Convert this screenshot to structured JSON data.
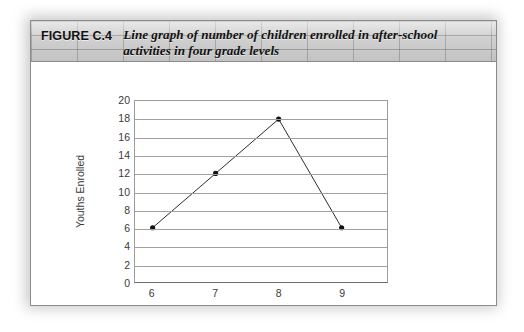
{
  "figure": {
    "number_label": "FIGURE C.4",
    "caption_line1": "Line graph of number of children enrolled in after-school",
    "caption_line2": "activities in four grade levels"
  },
  "colors": {
    "header_band": "#cfcfcf",
    "card_border": "#8c8c8c",
    "gridline": "#a0a0a0",
    "series_line": "#2b2b2b",
    "marker": "#111111",
    "text": "#3a3a3a"
  },
  "chart_data": {
    "type": "line",
    "title": "",
    "xlabel": "Grade Levels",
    "ylabel": "Youths Enrolled",
    "categories": [
      "6",
      "7",
      "8",
      "9"
    ],
    "x": [
      6,
      7,
      8,
      9
    ],
    "values": [
      6,
      12,
      18,
      6
    ],
    "series": [
      {
        "name": "Youths Enrolled",
        "values": [
          6,
          12,
          18,
          6
        ]
      }
    ],
    "ylim": [
      0,
      20
    ],
    "ytick_step": 2,
    "yticks": [
      20,
      18,
      16,
      14,
      12,
      10,
      8,
      6,
      4,
      2,
      0
    ],
    "xticks": [
      "6",
      "7",
      "8",
      "9"
    ],
    "grid": "horizontal",
    "legend": "none",
    "markers": "filled-circle"
  }
}
